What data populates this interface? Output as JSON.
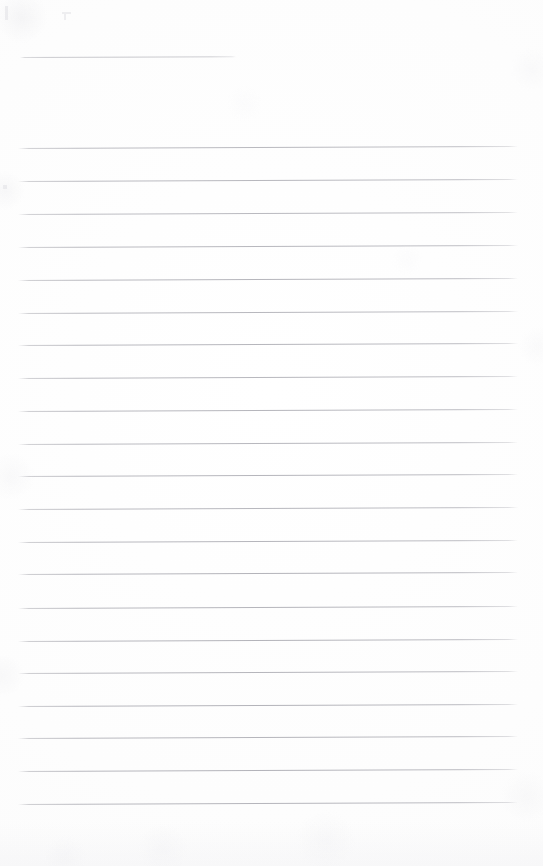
{
  "document": {
    "kind": "scanned-lined-paper",
    "title": "",
    "page_width": 543,
    "page_height": 866,
    "background_color": "#fdfdfd",
    "rule_color": "#8a8a94",
    "rule_thickness_px": 1,
    "rule_spacing_px": 32.7,
    "rule_tilt_deg": -0.22,
    "visible_text": ""
  },
  "rules": [
    {
      "id": "rule-01",
      "y": 57,
      "x": 20,
      "width": 216,
      "opacity": 0.55
    },
    {
      "id": "rule-02",
      "y": 148,
      "x": 18,
      "width": 500,
      "opacity": 0.7
    },
    {
      "id": "rule-03",
      "y": 181,
      "x": 18,
      "width": 500,
      "opacity": 0.72
    },
    {
      "id": "rule-04",
      "y": 214,
      "x": 18,
      "width": 500,
      "opacity": 0.7
    },
    {
      "id": "rule-05",
      "y": 247,
      "x": 18,
      "width": 500,
      "opacity": 0.72
    },
    {
      "id": "rule-06",
      "y": 280,
      "x": 18,
      "width": 500,
      "opacity": 0.74
    },
    {
      "id": "rule-07",
      "y": 313,
      "x": 18,
      "width": 500,
      "opacity": 0.72
    },
    {
      "id": "rule-08",
      "y": 345,
      "x": 18,
      "width": 500,
      "opacity": 0.74
    },
    {
      "id": "rule-09",
      "y": 378,
      "x": 18,
      "width": 500,
      "opacity": 0.72
    },
    {
      "id": "rule-10",
      "y": 411,
      "x": 18,
      "width": 500,
      "opacity": 0.74
    },
    {
      "id": "rule-11",
      "y": 444,
      "x": 18,
      "width": 500,
      "opacity": 0.72
    },
    {
      "id": "rule-12",
      "y": 476,
      "x": 18,
      "width": 500,
      "opacity": 0.74
    },
    {
      "id": "rule-13",
      "y": 509,
      "x": 18,
      "width": 500,
      "opacity": 0.72
    },
    {
      "id": "rule-14",
      "y": 542,
      "x": 18,
      "width": 500,
      "opacity": 0.74
    },
    {
      "id": "rule-15",
      "y": 574,
      "x": 18,
      "width": 500,
      "opacity": 0.76
    },
    {
      "id": "rule-16",
      "y": 608,
      "x": 18,
      "width": 500,
      "opacity": 0.74
    },
    {
      "id": "rule-17",
      "y": 641,
      "x": 18,
      "width": 500,
      "opacity": 0.76
    },
    {
      "id": "rule-18",
      "y": 673,
      "x": 18,
      "width": 500,
      "opacity": 0.74
    },
    {
      "id": "rule-19",
      "y": 706,
      "x": 18,
      "width": 500,
      "opacity": 0.76
    },
    {
      "id": "rule-20",
      "y": 738,
      "x": 18,
      "width": 500,
      "opacity": 0.74
    },
    {
      "id": "rule-21",
      "y": 771,
      "x": 18,
      "width": 500,
      "opacity": 0.76
    },
    {
      "id": "rule-22",
      "y": 804,
      "x": 18,
      "width": 500,
      "opacity": 0.74
    }
  ],
  "stray_marks": [
    {
      "id": "mark-01",
      "x": 62,
      "y": 12,
      "width": 9,
      "height": 2
    },
    {
      "id": "mark-02",
      "x": 64,
      "y": 14,
      "width": 2,
      "height": 6
    },
    {
      "id": "mark-03",
      "x": 3,
      "y": 185,
      "width": 4,
      "height": 4
    },
    {
      "id": "mark-04",
      "x": 5,
      "y": 6,
      "width": 3,
      "height": 14
    }
  ]
}
